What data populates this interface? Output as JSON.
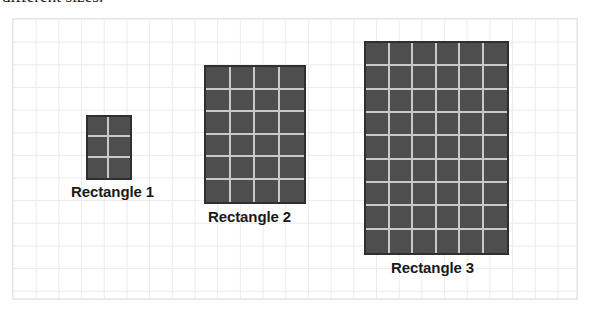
{
  "caption": {
    "text": "different sizes."
  },
  "panel": {
    "name": "grid-paper-panel",
    "grid_cell_px": 22.7,
    "border_color": "#e4e6e7",
    "gridline_color": "#e9ebec"
  },
  "style": {
    "rectangle_fill": "#4e4e4e",
    "rectangle_border": "#2f2f2f",
    "rectangle_gridline": "#c9c9c9",
    "label_color": "#1a1a1a",
    "background": "#ffffff"
  },
  "chart_data": {
    "type": "table",
    "xlabel": "",
    "ylabel": "",
    "columns": [
      "Shape",
      "Columns",
      "Rows",
      "Unit squares"
    ],
    "rows": [
      [
        "Rectangle 1",
        2,
        3,
        6
      ],
      [
        "Rectangle 2",
        4,
        6,
        24
      ],
      [
        "Rectangle 3",
        6,
        9,
        54
      ]
    ],
    "categories": [
      "Rectangle 1",
      "Rectangle 2",
      "Rectangle 3"
    ],
    "values": [
      6,
      24,
      54
    ],
    "legend": []
  },
  "rectangles": [
    {
      "id": "rectangle-1",
      "label": "Rectangle 1",
      "cols": 2,
      "rows": 3,
      "area_units": 6,
      "left": 85,
      "top": 114,
      "width": 46,
      "height": 65,
      "label_left": 70,
      "label_top": 182
    },
    {
      "id": "rectangle-2",
      "label": "Rectangle 2",
      "cols": 4,
      "rows": 6,
      "area_units": 24,
      "left": 203,
      "top": 64,
      "width": 102,
      "height": 139,
      "label_left": 207,
      "label_top": 207
    },
    {
      "id": "rectangle-3",
      "label": "Rectangle 3",
      "cols": 6,
      "rows": 9,
      "area_units": 54,
      "left": 363,
      "top": 40,
      "width": 145,
      "height": 214,
      "label_left": 390,
      "label_top": 258
    }
  ]
}
